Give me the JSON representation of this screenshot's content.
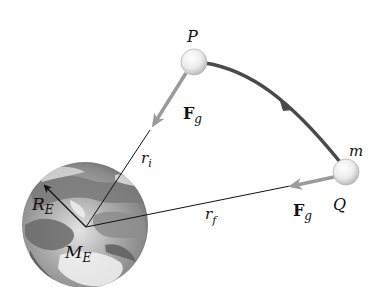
{
  "diagram": {
    "colors": {
      "background": "#ffffff",
      "earth_light": "#e8e8e8",
      "earth_mid": "#9a9a9a",
      "earth_dark": "#5a5a5a",
      "trajectory": "#4a4a4a",
      "force_arrow": "#9b9b9b",
      "vector_line": "#111111",
      "ball_fill": "#f2f2f2",
      "ball_edge": "#b5b5b5"
    },
    "labels": {
      "point_p": "P",
      "point_q": "Q",
      "mass": "m",
      "force_at_p_main": "F",
      "force_at_p_sub": "g",
      "force_at_q_main": "F",
      "force_at_q_sub": "g",
      "r_initial_main": "r",
      "r_initial_sub": "i",
      "r_final_main": "r",
      "r_final_sub": "f",
      "earth_radius_main": "R",
      "earth_radius_sub": "E",
      "earth_mass_main": "M",
      "earth_mass_sub": "E"
    },
    "elements": [
      {
        "id": "earth",
        "type": "sphere",
        "center": [
          85,
          225
        ],
        "radius": 63
      },
      {
        "id": "ball-p",
        "type": "sphere",
        "center": [
          194,
          62
        ],
        "radius": 13
      },
      {
        "id": "ball-q",
        "type": "sphere",
        "center": [
          346,
          172
        ],
        "radius": 13
      },
      {
        "id": "trajectory",
        "type": "curved-arrow",
        "from": "P",
        "to": "Q"
      },
      {
        "id": "r-i",
        "type": "line",
        "from": [
          86,
          227
        ],
        "to": [
          150,
          130
        ]
      },
      {
        "id": "r-f",
        "type": "line",
        "from": [
          86,
          227
        ],
        "to": [
          290,
          186
        ]
      },
      {
        "id": "R-E",
        "type": "arrow",
        "from": [
          86,
          227
        ],
        "to": [
          43,
          184
        ]
      },
      {
        "id": "Fg-p",
        "type": "arrow",
        "from": [
          185,
          75
        ],
        "to": [
          151,
          128
        ]
      },
      {
        "id": "Fg-q",
        "type": "arrow",
        "from": [
          334,
          177
        ],
        "to": [
          287,
          187
        ]
      }
    ]
  }
}
